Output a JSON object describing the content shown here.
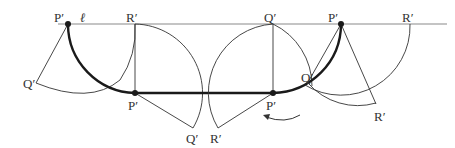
{
  "diagram": {
    "line_label": "ℓ",
    "labels": [
      {
        "id": "p1",
        "text": "P′",
        "x": 54,
        "y": 22
      },
      {
        "id": "r1",
        "text": "R′",
        "x": 126,
        "y": 22
      },
      {
        "id": "q1",
        "text": "Q′",
        "x": 264,
        "y": 22
      },
      {
        "id": "p2",
        "text": "P′",
        "x": 328,
        "y": 22
      },
      {
        "id": "r2",
        "text": "R′",
        "x": 402,
        "y": 22
      },
      {
        "id": "q_left",
        "text": "Q′",
        "x": 23,
        "y": 88
      },
      {
        "id": "p_mid_left",
        "text": "P′",
        "x": 128,
        "y": 110
      },
      {
        "id": "q_bottom",
        "text": "Q′",
        "x": 186,
        "y": 143
      },
      {
        "id": "r_bottom",
        "text": "R′",
        "x": 210,
        "y": 143
      },
      {
        "id": "p_mid_right",
        "text": "P′",
        "x": 266,
        "y": 110
      },
      {
        "id": "q_right",
        "text": "Q′",
        "x": 301,
        "y": 82
      },
      {
        "id": "r_right_low",
        "text": "R′",
        "x": 374,
        "y": 121
      }
    ],
    "colors": {
      "line": "#8a8a8a",
      "stroke": "#333333",
      "locus": "#1a1a1a"
    }
  }
}
